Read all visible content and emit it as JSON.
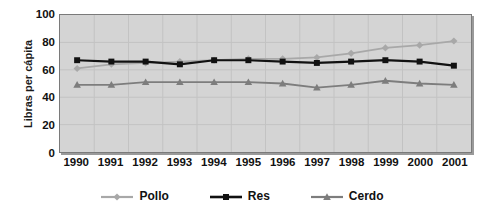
{
  "chart_data": {
    "type": "line",
    "title": "",
    "xlabel": "",
    "ylabel": "Libras per cápita",
    "categories": [
      "1990",
      "1991",
      "1992",
      "1993",
      "1994",
      "1995",
      "1996",
      "1997",
      "1998",
      "1999",
      "2000",
      "2001"
    ],
    "ylim": [
      0,
      100
    ],
    "yticks": [
      0,
      20,
      40,
      60,
      80,
      100
    ],
    "grid": true,
    "legend_position": "bottom",
    "series": [
      {
        "name": "Pollo",
        "color": "#a8a8a8",
        "marker": "diamond",
        "values": [
          61,
          64,
          65,
          66,
          67,
          68,
          68,
          69,
          72,
          76,
          78,
          81
        ]
      },
      {
        "name": "Res",
        "color": "#111111",
        "marker": "square",
        "values": [
          67,
          66,
          66,
          64,
          67,
          67,
          66,
          65,
          66,
          67,
          66,
          63
        ]
      },
      {
        "name": "Cerdo",
        "color": "#7d7d7d",
        "marker": "triangle",
        "values": [
          49,
          49,
          51,
          51,
          51,
          51,
          50,
          47,
          49,
          52,
          50,
          49
        ]
      }
    ]
  },
  "axis": {
    "y_title": "Libras per cápita",
    "y_tick_labels": [
      "100",
      "80",
      "60",
      "40",
      "20",
      "0"
    ],
    "x_tick_labels": [
      "1990",
      "1991",
      "1992",
      "1993",
      "1994",
      "1995",
      "1996",
      "1997",
      "1998",
      "1999",
      "2000",
      "2001"
    ]
  },
  "legend": {
    "entries": [
      {
        "label": "Pollo",
        "color": "#a8a8a8",
        "marker": "diamond"
      },
      {
        "label": "Res",
        "color": "#111111",
        "marker": "square"
      },
      {
        "label": "Cerdo",
        "color": "#7d7d7d",
        "marker": "triangle"
      }
    ]
  },
  "colors": {
    "plot_background": "#d4d4d4",
    "plot_border": "#7a7a7a",
    "gridline": "#c2c2c2",
    "page_background": "#ffffff",
    "text": "#111111"
  }
}
